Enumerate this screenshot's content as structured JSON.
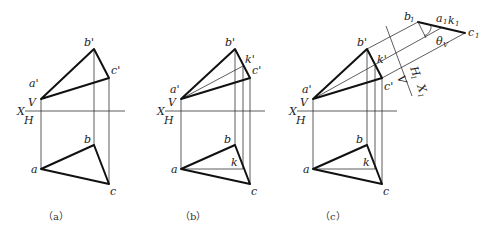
{
  "figure": {
    "panels": [
      {
        "id": "a",
        "caption": "（a）",
        "axis": {
          "x_label": "X",
          "v_label": "V",
          "h_label": "H"
        },
        "front_view": {
          "a": "a'",
          "b": "b'",
          "c": "c'"
        },
        "top_view": {
          "a": "a",
          "b": "b",
          "c": "c"
        }
      },
      {
        "id": "b",
        "caption": "（b）",
        "axis": {
          "x_label": "X",
          "v_label": "V",
          "h_label": "H"
        },
        "front_view": {
          "a": "a'",
          "b": "b'",
          "c": "c'",
          "k": "k'"
        },
        "top_view": {
          "a": "a",
          "b": "b",
          "c": "c",
          "k": "k"
        }
      },
      {
        "id": "c",
        "caption": "（c）",
        "axis": {
          "x_label": "X",
          "v_label": "V",
          "h_label": "H"
        },
        "front_view": {
          "a": "a'",
          "b": "b'",
          "c": "c'",
          "k": "k'"
        },
        "top_view": {
          "a": "a",
          "b": "b",
          "c": "c",
          "k": "k"
        },
        "aux_view": {
          "b1": "b",
          "a1k1": "a",
          "k1": "k",
          "c1": "c",
          "sub": "1",
          "angle": "θ",
          "angle_sub": "V",
          "axis_h1": "H",
          "axis_x1": "X",
          "axis_v": "V"
        }
      }
    ]
  }
}
